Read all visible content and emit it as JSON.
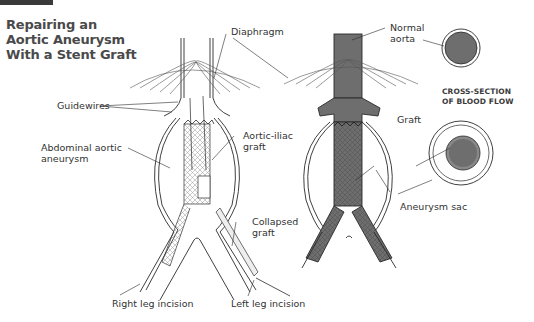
{
  "title": {
    "lines": [
      "Repairing an",
      "Aortic Aneurysm",
      "With a Stent Graft"
    ]
  },
  "labels": {
    "diaphragm": "Diaphragm",
    "guidewires": "Guidewires",
    "abdominal_aortic_aneurysm": [
      "Abdominal aortic",
      "aneurysm"
    ],
    "aortic_iliac_graft": [
      "Aortic-iliac",
      "graft"
    ],
    "collapsed_graft": [
      "Collapsed",
      "graft"
    ],
    "right_leg_incision": "Right leg incision",
    "left_leg_incision": "Left leg incision",
    "normal_aorta": [
      "Normal",
      "aorta"
    ],
    "graft": "Graft",
    "aneurysm_sac": "Aneurysm sac"
  },
  "cross_section": {
    "title_lines": [
      "CROSS-SECTION",
      "OF BLOOD FLOW"
    ]
  },
  "colors": {
    "header_bar": "#3a3a3a",
    "title_text": "#4a4a4a",
    "blood": "#6e6e6e",
    "line": "#2a2a2a"
  }
}
